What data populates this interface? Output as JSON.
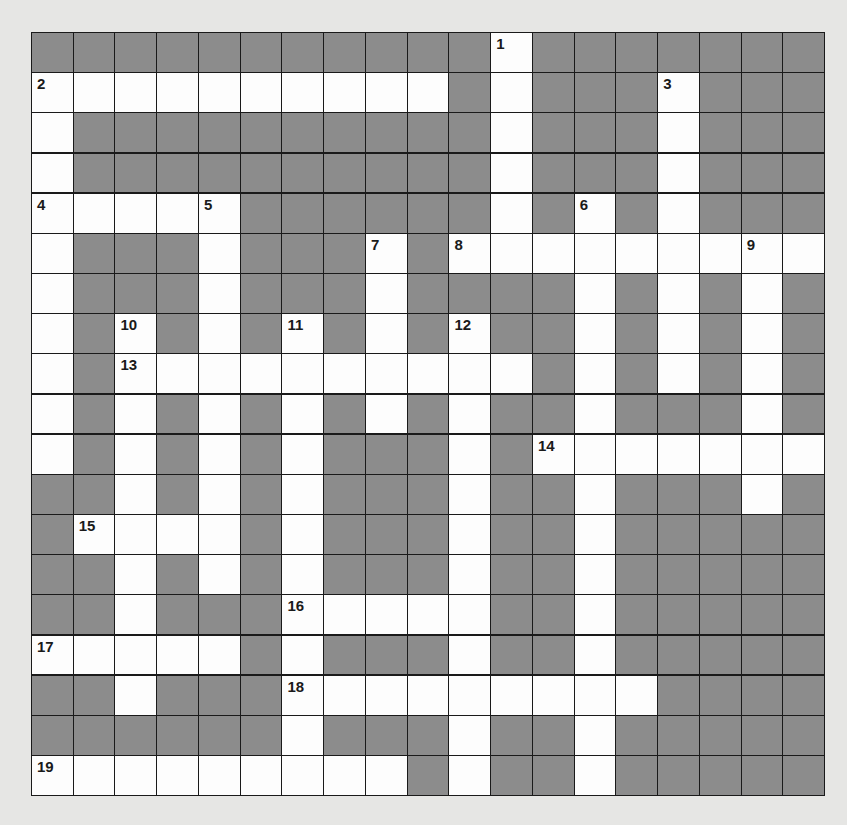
{
  "puzzle": {
    "type": "crossword",
    "rows": 19,
    "cols": 19,
    "colors": {
      "block": "#8c8c8c",
      "open": "#fdfdfd",
      "line": "#1a1a1a",
      "page": "#e6e6e4"
    },
    "layout": [
      "0000000000010000000",
      "1111111111010001000",
      "1000000000010001000",
      "1000000000010001000",
      "1111100000010101000",
      "1000100010111111111",
      "1000100010000101010",
      "1010101010100101010",
      "1011111111110101010",
      "1010101010100100010",
      "1010101000101111111",
      "0010101000100100010",
      "0111101000100100000",
      "0010101000100100000",
      "0010001111100100000",
      "1111101000100100000",
      "0010001111111110000",
      "0000001000100100000",
      "1111111110100100000"
    ],
    "numbers": [
      {
        "n": "1",
        "row": 0,
        "col": 11
      },
      {
        "n": "2",
        "row": 1,
        "col": 0
      },
      {
        "n": "3",
        "row": 1,
        "col": 15
      },
      {
        "n": "4",
        "row": 4,
        "col": 0
      },
      {
        "n": "5",
        "row": 4,
        "col": 4
      },
      {
        "n": "6",
        "row": 4,
        "col": 13
      },
      {
        "n": "7",
        "row": 5,
        "col": 8
      },
      {
        "n": "8",
        "row": 5,
        "col": 10
      },
      {
        "n": "9",
        "row": 5,
        "col": 17
      },
      {
        "n": "10",
        "row": 7,
        "col": 2
      },
      {
        "n": "11",
        "row": 7,
        "col": 6
      },
      {
        "n": "12",
        "row": 7,
        "col": 10
      },
      {
        "n": "13",
        "row": 8,
        "col": 2
      },
      {
        "n": "14",
        "row": 10,
        "col": 12
      },
      {
        "n": "15",
        "row": 12,
        "col": 1
      },
      {
        "n": "16",
        "row": 14,
        "col": 6
      },
      {
        "n": "17",
        "row": 15,
        "col": 0
      },
      {
        "n": "18",
        "row": 16,
        "col": 6
      },
      {
        "n": "19",
        "row": 18,
        "col": 0
      }
    ]
  }
}
